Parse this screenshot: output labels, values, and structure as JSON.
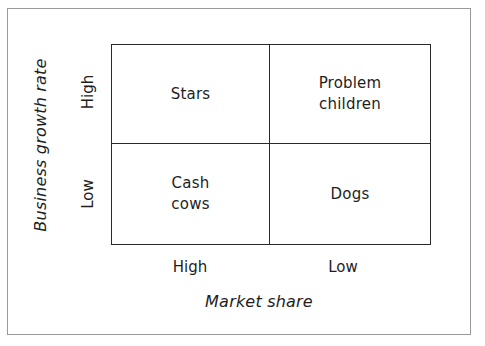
{
  "diagram": {
    "type": "2x2 matrix",
    "y_axis": {
      "label": "Business growth rate",
      "ticks": [
        "High",
        "Low"
      ]
    },
    "x_axis": {
      "label": "Market share",
      "ticks": [
        "High",
        "Low"
      ]
    },
    "quadrants": {
      "top_left": {
        "lines": [
          "Stars"
        ]
      },
      "top_right": {
        "lines": [
          "Problem",
          "children"
        ]
      },
      "bottom_left": {
        "lines": [
          "Cash",
          "cows"
        ]
      },
      "bottom_right": {
        "lines": [
          "Dogs"
        ]
      }
    }
  },
  "colors": {
    "grid_line": "#2a2a2a",
    "frame_border": "#9a9a9a",
    "text": "#1e1e1e",
    "background": "#ffffff"
  }
}
